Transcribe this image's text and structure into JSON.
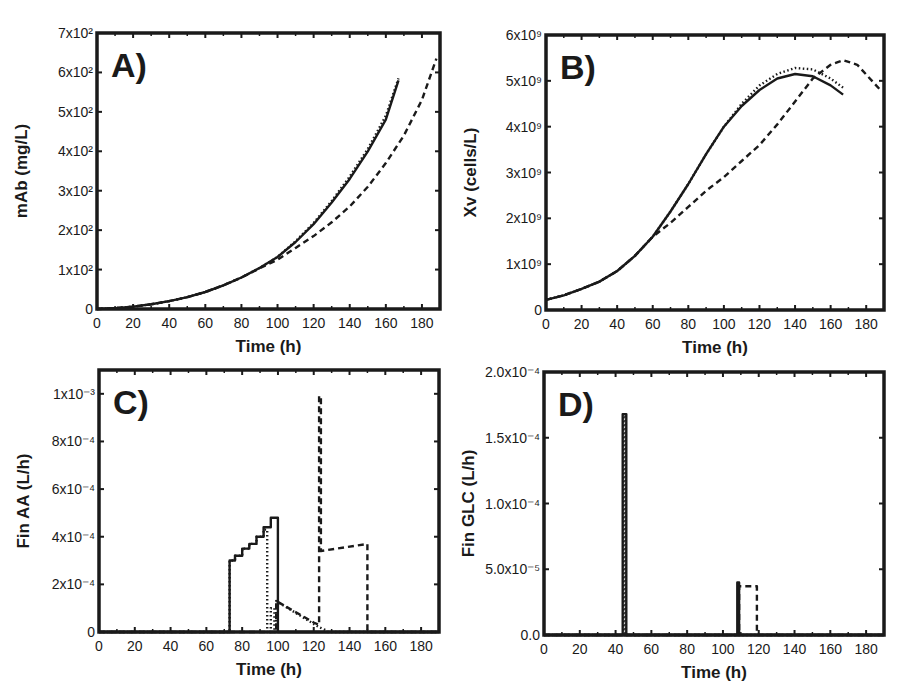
{
  "chart_data": [
    {
      "id": "A",
      "type": "line",
      "panel_label": "A)",
      "title": "",
      "xlabel": "Time (h)",
      "ylabel": "mAb (mg/L)",
      "xlim": [
        0,
        190
      ],
      "ylim": [
        0,
        700
      ],
      "xticks": [
        "0",
        "20",
        "40",
        "60",
        "80",
        "100",
        "120",
        "140",
        "160",
        "180"
      ],
      "yticks": [
        "0",
        "1x10²",
        "2x10²",
        "3x10²",
        "4x10²",
        "5x10²",
        "6x10²",
        "7x10²"
      ],
      "grid": false,
      "legend": null,
      "frame": {
        "x0": 97,
        "y0": 33,
        "x1": 440,
        "y1": 309
      },
      "series": [
        {
          "name": "solid",
          "style": "solid",
          "x": [
            0,
            10,
            20,
            30,
            40,
            50,
            60,
            70,
            80,
            90,
            100,
            110,
            120,
            130,
            140,
            150,
            160,
            167
          ],
          "y": [
            0,
            2,
            6,
            12,
            20,
            30,
            43,
            60,
            80,
            104,
            132,
            170,
            215,
            270,
            330,
            400,
            480,
            580
          ]
        },
        {
          "name": "dotted",
          "style": "dotted",
          "x": [
            0,
            10,
            20,
            30,
            40,
            50,
            60,
            70,
            80,
            90,
            100,
            110,
            120,
            130,
            140,
            150,
            160,
            167
          ],
          "y": [
            0,
            2,
            6,
            12,
            20,
            30,
            43,
            60,
            80,
            104,
            132,
            172,
            218,
            274,
            336,
            406,
            490,
            585
          ]
        },
        {
          "name": "dashed",
          "style": "dashed",
          "x": [
            0,
            10,
            20,
            30,
            40,
            50,
            60,
            70,
            80,
            90,
            100,
            110,
            120,
            130,
            140,
            150,
            160,
            170,
            180,
            188
          ],
          "y": [
            0,
            2,
            6,
            12,
            20,
            30,
            43,
            60,
            80,
            103,
            125,
            155,
            185,
            220,
            260,
            310,
            370,
            440,
            530,
            635
          ]
        }
      ]
    },
    {
      "id": "B",
      "type": "line",
      "panel_label": "B)",
      "title": "",
      "xlabel": "Time (h)",
      "ylabel": "Xv (cells/L)",
      "xlim": [
        0,
        190
      ],
      "ylim": [
        0,
        6000000000
      ],
      "xticks": [
        "0",
        "20",
        "40",
        "60",
        "80",
        "100",
        "120",
        "140",
        "160",
        "180"
      ],
      "yticks": [
        "0",
        "1x10⁹",
        "2x10⁹",
        "3x10⁹",
        "4x10⁹",
        "5x10⁹",
        "6x10⁹"
      ],
      "grid": false,
      "legend": null,
      "frame": {
        "x0": 546,
        "y0": 35,
        "x1": 884,
        "y1": 310
      },
      "series": [
        {
          "name": "solid",
          "style": "solid",
          "x": [
            0,
            10,
            20,
            30,
            40,
            50,
            60,
            70,
            80,
            90,
            100,
            110,
            120,
            130,
            140,
            150,
            160,
            167
          ],
          "y": [
            220000000.0,
            320000000.0,
            460000000.0,
            620000000.0,
            850000000.0,
            1180000000.0,
            1600000000.0,
            2150000000.0,
            2750000000.0,
            3400000000.0,
            4000000000.0,
            4450000000.0,
            4800000000.0,
            5050000000.0,
            5150000000.0,
            5100000000.0,
            4900000000.0,
            4700000000.0
          ]
        },
        {
          "name": "dotted",
          "style": "dotted",
          "x": [
            0,
            10,
            20,
            30,
            40,
            50,
            60,
            70,
            80,
            90,
            100,
            110,
            120,
            130,
            140,
            150,
            160,
            167
          ],
          "y": [
            220000000.0,
            320000000.0,
            460000000.0,
            620000000.0,
            850000000.0,
            1180000000.0,
            1600000000.0,
            2150000000.0,
            2750000000.0,
            3400000000.0,
            4000000000.0,
            4500000000.0,
            4900000000.0,
            5150000000.0,
            5280000000.0,
            5250000000.0,
            5050000000.0,
            4850000000.0
          ]
        },
        {
          "name": "dashed",
          "style": "dashed",
          "x": [
            0,
            10,
            20,
            30,
            40,
            50,
            60,
            70,
            80,
            90,
            100,
            110,
            120,
            130,
            140,
            150,
            160,
            167,
            175,
            188
          ],
          "y": [
            220000000.0,
            320000000.0,
            460000000.0,
            620000000.0,
            850000000.0,
            1180000000.0,
            1600000000.0,
            1900000000.0,
            2250000000.0,
            2600000000.0,
            2900000000.0,
            3250000000.0,
            3600000000.0,
            4050000000.0,
            4550000000.0,
            5050000000.0,
            5350000000.0,
            5450000000.0,
            5350000000.0,
            4800000000.0
          ]
        }
      ]
    },
    {
      "id": "C",
      "type": "line",
      "panel_label": "C)",
      "title": "",
      "xlabel": "Time (h)",
      "ylabel": "Fin AA (L/h)",
      "xlim": [
        0,
        190
      ],
      "ylim": [
        0,
        0.0011
      ],
      "xticks": [
        "0",
        "20",
        "40",
        "60",
        "80",
        "100",
        "120",
        "140",
        "160",
        "180"
      ],
      "yticks": [
        "0",
        "2x10⁻⁴",
        "4x10⁻⁴",
        "6x10⁻⁴",
        "8x10⁻⁴",
        "1x10⁻³"
      ],
      "ytick_values": [
        0,
        0.0002,
        0.0004,
        0.0006,
        0.0008,
        0.001
      ],
      "grid": false,
      "legend": null,
      "frame": {
        "x0": 99,
        "y0": 370,
        "x1": 439,
        "y1": 632
      },
      "series": [
        {
          "name": "solid",
          "style": "solid",
          "x": [
            0,
            73,
            73,
            76,
            76,
            80,
            80,
            84,
            84,
            88,
            88,
            92,
            92,
            96,
            96,
            100,
            100,
            190
          ],
          "y": [
            0,
            0,
            0.0003,
            0.0003,
            0.00032,
            0.00032,
            0.00035,
            0.00035,
            0.00037,
            0.00037,
            0.0004,
            0.0004,
            0.00044,
            0.00044,
            0.00048,
            0.00048,
            0,
            0
          ]
        },
        {
          "name": "dotted",
          "style": "dotted",
          "x": [
            0,
            73,
            73,
            76,
            76,
            80,
            80,
            84,
            84,
            88,
            88,
            92,
            92,
            94,
            94,
            96,
            96,
            98,
            98,
            99,
            99,
            123,
            126,
            128,
            190
          ],
          "y": [
            0,
            0,
            0.0003,
            0.0003,
            0.00032,
            0.00032,
            0.00035,
            0.00035,
            0.00037,
            0.00037,
            0.0004,
            0.0004,
            0.00043,
            0.00043,
            0,
            0,
            0.0001,
            0.0001,
            0,
            0,
            0.00013,
            2e-05,
            1e-05,
            0,
            0
          ]
        },
        {
          "name": "dashed",
          "style": "dashed",
          "x": [
            0,
            99,
            99,
            120,
            123,
            123,
            124,
            124,
            150,
            150,
            190
          ],
          "y": [
            0,
            0,
            0.00013,
            4e-05,
            3e-05,
            0.00099,
            0.00099,
            0.00034,
            0.00037,
            0,
            0
          ]
        }
      ]
    },
    {
      "id": "D",
      "type": "line",
      "panel_label": "D)",
      "title": "",
      "xlabel": "Time (h)",
      "ylabel": "Fin GLC (L/h)",
      "xlim": [
        0,
        190
      ],
      "ylim": [
        0,
        0.0002
      ],
      "xticks": [
        "0",
        "20",
        "40",
        "60",
        "80",
        "100",
        "120",
        "140",
        "160",
        "180"
      ],
      "yticks": [
        "0.0",
        "5.0x10⁻⁵",
        "1.0x10⁻⁴",
        "1.5x10⁻⁴",
        "2.0x10⁻⁴"
      ],
      "ytick_values": [
        0,
        5e-05,
        0.0001,
        0.00015,
        0.0002
      ],
      "grid": false,
      "legend": null,
      "frame": {
        "x0": 544,
        "y0": 372,
        "x1": 884,
        "y1": 635
      },
      "series": [
        {
          "name": "solid",
          "style": "solid",
          "x": [
            0,
            44,
            44,
            46,
            46,
            108,
            108,
            109,
            109,
            190
          ],
          "y": [
            0,
            0,
            0.000168,
            0.000168,
            0,
            0,
            4e-05,
            4e-05,
            0,
            0
          ]
        },
        {
          "name": "dotted",
          "style": "dotted",
          "x": [
            0,
            44.5,
            44.5,
            45.5,
            45.5,
            190
          ],
          "y": [
            0,
            0,
            0.000168,
            0.000168,
            0,
            0
          ]
        },
        {
          "name": "dashed",
          "style": "dashed",
          "x": [
            0,
            109,
            109,
            119,
            119,
            190
          ],
          "y": [
            0,
            0,
            3.7e-05,
            3.7e-05,
            0,
            0
          ]
        }
      ]
    }
  ]
}
